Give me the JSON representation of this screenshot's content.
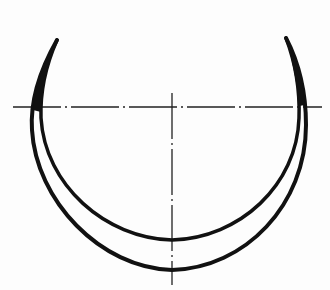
{
  "diagram": {
    "type": "technical-drawing",
    "colors": {
      "stroke": "#111111",
      "centerline": "#222222",
      "background": "#fdfdfd"
    },
    "centerlines": {
      "horizontal": {
        "x1": 13,
        "y1": 107,
        "x2": 322,
        "y2": 107
      },
      "vertical": {
        "x1": 172,
        "y1": 93,
        "x2": 172,
        "y2": 285
      }
    },
    "arcs": {
      "outer": {
        "start": [
          57,
          40
        ],
        "bottom": [
          172,
          270
        ],
        "end": [
          286,
          38
        ]
      },
      "inner": {
        "start": [
          57,
          40
        ],
        "bottom": [
          172,
          240
        ],
        "end": [
          286,
          38
        ]
      }
    }
  }
}
